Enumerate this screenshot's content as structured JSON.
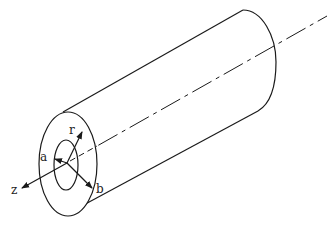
{
  "diagram": {
    "labels": {
      "r": "r",
      "a": "a",
      "b": "b",
      "z": "z"
    },
    "colors": {
      "stroke": "#1a1a1a",
      "background": "#ffffff"
    }
  }
}
